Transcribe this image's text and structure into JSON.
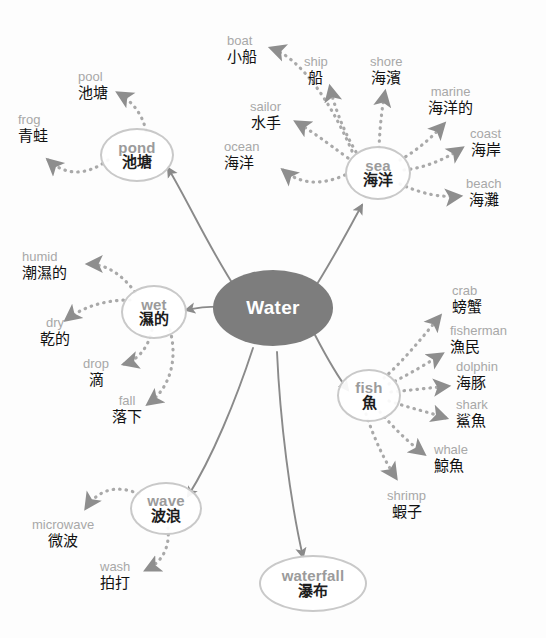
{
  "colors": {
    "center_fill": "#7d7d7d",
    "center_text": "#ffffff",
    "node_outline": "#c9c9c9",
    "english_text": "#a8a8a8",
    "chinese_text": "#111111",
    "solid_edge": "#8a8a8a",
    "dotted_edge": "#a9a9a9",
    "background": "#fdfdfd"
  },
  "center": {
    "label": "Water"
  },
  "branches": [
    {
      "id": "pond",
      "en": "pond",
      "zh": "池塘",
      "children": [
        {
          "en": "pool",
          "zh": "池塘"
        },
        {
          "en": "frog",
          "zh": "青蛙"
        }
      ]
    },
    {
      "id": "sea",
      "en": "sea",
      "zh": "海洋",
      "children": [
        {
          "en": "boat",
          "zh": "小船"
        },
        {
          "en": "ship",
          "zh": "船"
        },
        {
          "en": "sailor",
          "zh": "水手"
        },
        {
          "en": "ocean",
          "zh": "海洋"
        },
        {
          "en": "shore",
          "zh": "海濱"
        },
        {
          "en": "marine",
          "zh": "海洋的"
        },
        {
          "en": "coast",
          "zh": "海岸"
        },
        {
          "en": "beach",
          "zh": "海灘"
        }
      ]
    },
    {
      "id": "wet",
      "en": "wet",
      "zh": "濕的",
      "children": [
        {
          "en": "humid",
          "zh": "潮濕的"
        },
        {
          "en": "dry",
          "zh": "乾的"
        },
        {
          "en": "drop",
          "zh": "滴"
        },
        {
          "en": "fall",
          "zh": "落下"
        }
      ]
    },
    {
      "id": "fish",
      "en": "fish",
      "zh": "魚",
      "children": [
        {
          "en": "crab",
          "zh": "螃蟹"
        },
        {
          "en": "fisherman",
          "zh": "漁民"
        },
        {
          "en": "dolphin",
          "zh": "海豚"
        },
        {
          "en": "shark",
          "zh": "鯊魚"
        },
        {
          "en": "whale",
          "zh": "鯨魚"
        },
        {
          "en": "shrimp",
          "zh": "蝦子"
        }
      ]
    },
    {
      "id": "wave",
      "en": "wave",
      "zh": "波浪",
      "children": [
        {
          "en": "microwave",
          "zh": "微波"
        },
        {
          "en": "wash",
          "zh": "拍打"
        }
      ]
    },
    {
      "id": "waterfall",
      "en": "waterfall",
      "zh": "瀑布",
      "children": []
    }
  ]
}
